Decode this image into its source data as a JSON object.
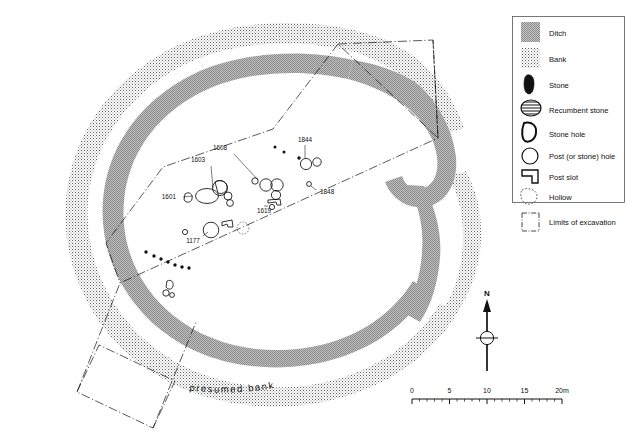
{
  "figure": {
    "type": "archaeological-site-plan",
    "presumed_bank_label": "presumed bank"
  },
  "legend": {
    "title": "",
    "items": [
      {
        "symbol": "ditch-swatch",
        "label": "Ditch"
      },
      {
        "symbol": "bank-swatch",
        "label": "Bank"
      },
      {
        "symbol": "stone-symbol",
        "label": "Stone"
      },
      {
        "symbol": "recumbent-stone-symbol",
        "label": "Recumbent stone"
      },
      {
        "symbol": "stone-hole-symbol",
        "label": "Stone hole"
      },
      {
        "symbol": "post-hole-symbol",
        "label": "Post (or stone) hole"
      },
      {
        "symbol": "post-slot-symbol",
        "label": "Post slot"
      },
      {
        "symbol": "hollow-symbol",
        "label": "Hollow"
      },
      {
        "symbol": "limits-symbol",
        "label": "Limits of excavation"
      }
    ]
  },
  "north_arrow": {
    "label": "N"
  },
  "scale_bar": {
    "ticks": [
      "0",
      "5",
      "10",
      "15",
      "20m"
    ],
    "major_interval_m": 5,
    "minor_interval_m": 1,
    "total_m": 20
  },
  "feature_labels": [
    {
      "id": "1608",
      "x": 230,
      "y": 147
    },
    {
      "id": "1603",
      "x": 206,
      "y": 159
    },
    {
      "id": "1601",
      "x": 180,
      "y": 196
    },
    {
      "id": "1619",
      "x": 256,
      "y": 209
    },
    {
      "id": "1177",
      "x": 192,
      "y": 239
    },
    {
      "id": "1844",
      "x": 303,
      "y": 139
    },
    {
      "id": "1848",
      "x": 317,
      "y": 192
    }
  ],
  "colors": {
    "ditch_fill": "#9a9a9a",
    "bank_dot": "#6e6e6e",
    "ink": "#111111",
    "paper": "#ffffff",
    "legend_border": "#555555"
  }
}
